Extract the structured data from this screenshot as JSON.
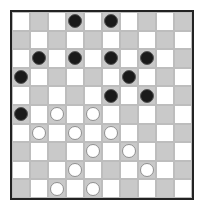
{
  "board": {
    "size": 10,
    "colors": {
      "light": "#ffffff",
      "dark": "#c9c9c9",
      "border": "#222222",
      "black_piece": "#1a1a1a",
      "white_piece": "#ffffff"
    },
    "pieces": [
      {
        "row": 0,
        "col": 3,
        "color": "black"
      },
      {
        "row": 0,
        "col": 5,
        "color": "black"
      },
      {
        "row": 2,
        "col": 1,
        "color": "black"
      },
      {
        "row": 2,
        "col": 3,
        "color": "black"
      },
      {
        "row": 2,
        "col": 5,
        "color": "black"
      },
      {
        "row": 2,
        "col": 7,
        "color": "black"
      },
      {
        "row": 3,
        "col": 0,
        "color": "black"
      },
      {
        "row": 3,
        "col": 6,
        "color": "black"
      },
      {
        "row": 4,
        "col": 5,
        "color": "black"
      },
      {
        "row": 4,
        "col": 7,
        "color": "black"
      },
      {
        "row": 5,
        "col": 0,
        "color": "black"
      },
      {
        "row": 5,
        "col": 2,
        "color": "white"
      },
      {
        "row": 5,
        "col": 4,
        "color": "white"
      },
      {
        "row": 6,
        "col": 1,
        "color": "white"
      },
      {
        "row": 6,
        "col": 3,
        "color": "white"
      },
      {
        "row": 6,
        "col": 5,
        "color": "white"
      },
      {
        "row": 7,
        "col": 4,
        "color": "white"
      },
      {
        "row": 7,
        "col": 6,
        "color": "white"
      },
      {
        "row": 8,
        "col": 3,
        "color": "white"
      },
      {
        "row": 8,
        "col": 7,
        "color": "white"
      },
      {
        "row": 9,
        "col": 2,
        "color": "white"
      },
      {
        "row": 9,
        "col": 4,
        "color": "white"
      }
    ]
  }
}
